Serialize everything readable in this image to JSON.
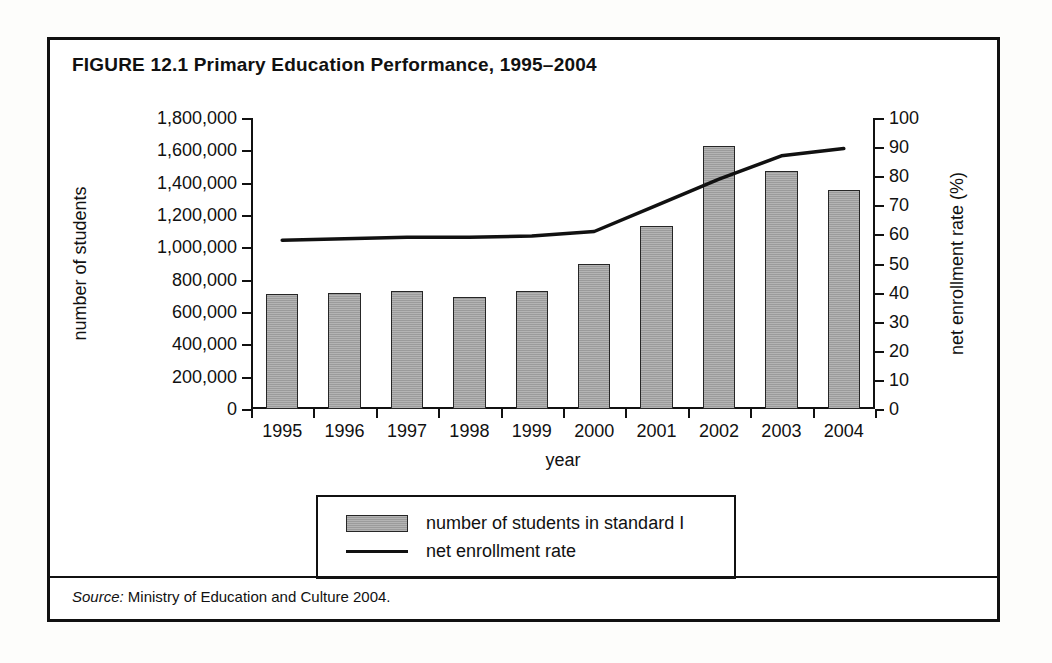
{
  "figure": {
    "title": "FIGURE 12.1  Primary Education Performance, 1995–2004",
    "source_label": "Source:",
    "source_text": " Ministry of Education and Culture 2004."
  },
  "legend": {
    "items": [
      {
        "marker": "bar",
        "label": "number of students in standard I"
      },
      {
        "marker": "line",
        "label": "net enrollment rate"
      }
    ]
  },
  "colors": {
    "bar_fill": "#9b9b9b",
    "bar_border": "#262626",
    "line": "#111111",
    "frame": "#111111",
    "background": "#ffffff"
  },
  "chart_data": {
    "type": "bar",
    "title": "FIGURE 12.1  Primary Education Performance, 1995–2004",
    "xlabel": "year",
    "ylabel": "number of students",
    "y2label": "net enrollment rate (%)",
    "categories": [
      "1995",
      "1996",
      "1997",
      "1998",
      "1999",
      "2000",
      "2001",
      "2002",
      "2003",
      "2004"
    ],
    "ylim": [
      0,
      1800000
    ],
    "y2lim": [
      0,
      100
    ],
    "yticks": [
      0,
      200000,
      400000,
      600000,
      800000,
      1000000,
      1200000,
      1400000,
      1600000,
      1800000
    ],
    "ytick_labels": [
      "0",
      "200,000",
      "400,000",
      "600,000",
      "800,000",
      "1,000,000",
      "1,200,000",
      "1,400,000",
      "1,600,000",
      "1,800,000"
    ],
    "y2ticks": [
      0,
      10,
      20,
      30,
      40,
      50,
      60,
      70,
      80,
      90,
      100
    ],
    "y2tick_labels": [
      "0",
      "10",
      "20",
      "30",
      "40",
      "50",
      "60",
      "70",
      "80",
      "90",
      "100"
    ],
    "grid": false,
    "legend_position": "bottom",
    "series": [
      {
        "name": "number of students in standard I",
        "type": "bar",
        "axis": "left",
        "values": [
          710000,
          720000,
          730000,
          690000,
          730000,
          895000,
          1130000,
          1625000,
          1470000,
          1355000
        ]
      },
      {
        "name": "net enrollment rate",
        "type": "line",
        "axis": "right",
        "values": [
          58,
          58.5,
          59,
          59,
          59.5,
          61,
          70,
          79,
          87,
          89.5
        ]
      }
    ]
  }
}
